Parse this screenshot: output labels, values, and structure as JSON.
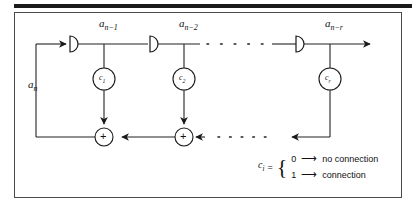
{
  "figure": {
    "frame_color": "#4a4a4a",
    "line_color": "#222222",
    "top_rule_color": "#1a1a1a"
  },
  "signals": {
    "input_label_base": "a",
    "input_label_sub": "n",
    "tap1_base": "a",
    "tap1_sub": "n−1",
    "tap2_base": "a",
    "tap2_sub": "n−2",
    "tap_r_base": "a",
    "tap_r_sub": "n−r"
  },
  "coefficients": [
    {
      "base": "c",
      "sub": "1",
      "name": "coefficient-c1"
    },
    {
      "base": "c",
      "sub": "2",
      "name": "coefficient-c2"
    },
    {
      "base": "c",
      "sub": "r",
      "name": "coefficient-cr"
    }
  ],
  "adders": [
    {
      "symbol": "+",
      "name": "adder-1"
    },
    {
      "symbol": "+",
      "name": "adder-2"
    }
  ],
  "delay_elements": [
    {
      "name": "delay-element-1"
    },
    {
      "name": "delay-element-2"
    },
    {
      "name": "delay-element-r"
    }
  ],
  "legend": {
    "subject_base": "c",
    "subject_sub": "i",
    "equals": "=",
    "rows": [
      {
        "value": "0",
        "arrow": "⟶",
        "meaning": "no connection"
      },
      {
        "value": "1",
        "arrow": "⟶",
        "meaning": "connection"
      }
    ]
  },
  "ellipsis": {
    "top_dots": 5,
    "bottom_dots": 7
  }
}
